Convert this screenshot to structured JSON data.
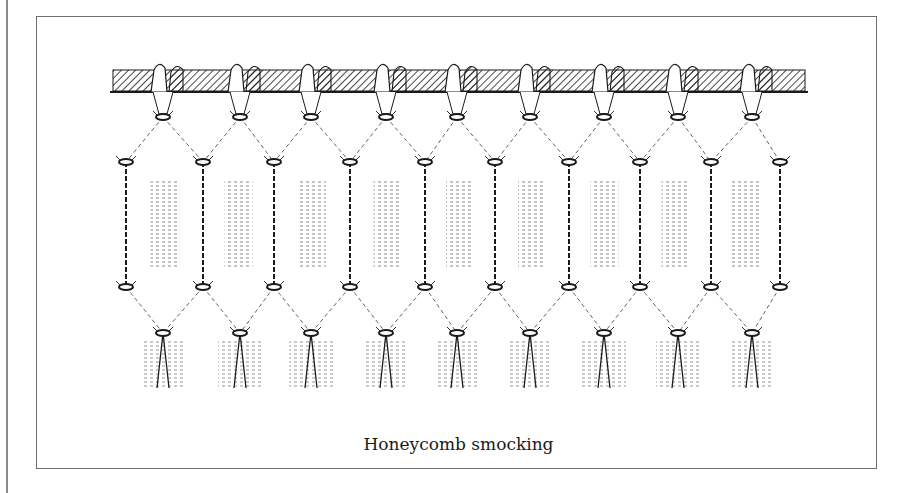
{
  "figure": {
    "caption": "Honeycomb smocking",
    "ink_color": "#1a1a1a",
    "frame_color": "#6e6e6e",
    "pleat_groups": 9
  }
}
